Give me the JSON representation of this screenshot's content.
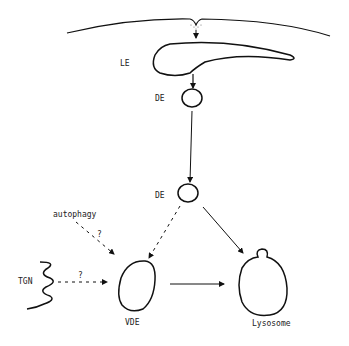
{
  "diagram": {
    "type": "endocytic-pathway-schematic",
    "colors": {
      "line": "#111111",
      "background": "#ffffff",
      "text": "#222222"
    },
    "nodes": [
      {
        "id": "plasma-membrane",
        "label": ""
      },
      {
        "id": "le",
        "label": "LE"
      },
      {
        "id": "de1",
        "label": "DE"
      },
      {
        "id": "de2",
        "label": "DE"
      },
      {
        "id": "vde",
        "label": "VDE"
      },
      {
        "id": "lysosome",
        "label": "Lysosome"
      },
      {
        "id": "tgn",
        "label": "TGN"
      },
      {
        "id": "autophagy",
        "label": "autophagy"
      }
    ],
    "edges": [
      {
        "from": "plasma-membrane",
        "to": "le",
        "style": "solid"
      },
      {
        "from": "le",
        "to": "de1",
        "style": "solid"
      },
      {
        "from": "de1",
        "to": "de2",
        "style": "solid"
      },
      {
        "from": "de2",
        "to": "vde",
        "style": "dashed"
      },
      {
        "from": "de2",
        "to": "lysosome",
        "style": "solid"
      },
      {
        "from": "autophagy",
        "to": "vde",
        "style": "dashed",
        "label": "?"
      },
      {
        "from": "tgn",
        "to": "vde",
        "style": "dashed",
        "label": "?"
      },
      {
        "from": "vde",
        "to": "lysosome",
        "style": "solid"
      }
    ]
  },
  "labels": {
    "le": "LE",
    "de1": "DE",
    "de2": "DE",
    "vde": "VDE",
    "lysosome": "Lysosome",
    "tgn": "TGN",
    "autophagy": "autophagy",
    "q_autophagy": "?",
    "q_tgn": "?"
  }
}
